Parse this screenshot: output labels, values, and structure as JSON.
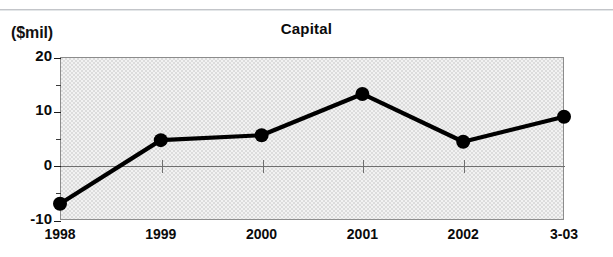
{
  "chart_data": {
    "type": "line",
    "title": "Capital",
    "xlabel": "",
    "ylabel": "($mil)",
    "unit_label": "($mil)",
    "categories": [
      "1998",
      "1999",
      "2000",
      "2001",
      "2002",
      "3-03"
    ],
    "values": [
      -7,
      4.7,
      5.6,
      13.2,
      4.4,
      9
    ],
    "series": [
      {
        "name": "Capital",
        "values": [
          -7,
          4.7,
          5.6,
          13.2,
          4.4,
          9
        ]
      }
    ],
    "ylim": [
      -10,
      20
    ],
    "ytick_labels": [
      "20",
      "10",
      "0",
      "-10"
    ],
    "ytick_values": [
      20,
      10,
      0,
      -10
    ],
    "yminor_values": [
      15,
      5,
      -5
    ],
    "xtick_labels": [
      "1998",
      "1999",
      "2000",
      "2001",
      "2002",
      "3-03"
    ],
    "grid": false,
    "zero_line": true,
    "legend": "none",
    "marker": "filled-circle",
    "line_color": "#000000",
    "marker_color": "#000000",
    "plot_background": "#dcdcdc",
    "frame_color": "#8c8c8c",
    "text_color": "#0b0b0b"
  },
  "figure": {
    "title": "Capital",
    "unit_label": "($mil)"
  }
}
